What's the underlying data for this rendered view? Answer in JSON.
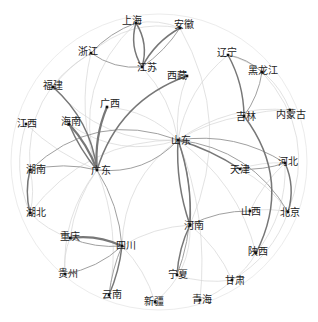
{
  "chart_data": {
    "type": "network",
    "layout": "circular-ish force layout with curved edges",
    "edge_style": "curved arcs, gray, thickness and darkness proportional to weight",
    "colors": {
      "node": "#111111",
      "label": "#222222",
      "edge_strong": "#777777",
      "edge_medium": "#a0a0a0",
      "edge_weak": "#d6d6d6"
    },
    "nodes": [
      {
        "id": "shanghai",
        "label": "上海",
        "x": 136,
        "y": 23,
        "lx": -14,
        "ly": -3
      },
      {
        "id": "anhui",
        "label": "安徽",
        "x": 180,
        "y": 28,
        "lx": -6,
        "ly": -4
      },
      {
        "id": "zhejiang",
        "label": "浙江",
        "x": 91,
        "y": 53,
        "lx": -13,
        "ly": -2
      },
      {
        "id": "jiangsu",
        "label": "江苏",
        "x": 142,
        "y": 67,
        "lx": -5,
        "ly": 0
      },
      {
        "id": "liaoning",
        "label": "辽宁",
        "x": 228,
        "y": 55,
        "lx": -11,
        "ly": -3
      },
      {
        "id": "heilongjiang",
        "label": "黑龙江",
        "x": 262,
        "y": 72,
        "lx": -14,
        "ly": -2
      },
      {
        "id": "xizang",
        "label": "西藏",
        "x": 187,
        "y": 76,
        "lx": -20,
        "ly": -1
      },
      {
        "id": "fujian",
        "label": "福建",
        "x": 53,
        "y": 87,
        "lx": -10,
        "ly": -2
      },
      {
        "id": "guangxi",
        "label": "广西",
        "x": 107,
        "y": 107,
        "lx": -7,
        "ly": -4
      },
      {
        "id": "jilin",
        "label": "吉林",
        "x": 244,
        "y": 116,
        "lx": -8,
        "ly": 0
      },
      {
        "id": "neimenggu",
        "label": "内蒙古",
        "x": 290,
        "y": 110,
        "lx": -14,
        "ly": 4
      },
      {
        "id": "hainan",
        "label": "海南",
        "x": 69,
        "y": 124,
        "lx": -8,
        "ly": -3
      },
      {
        "id": "jiangxi",
        "label": "江西",
        "x": 26,
        "y": 124,
        "lx": -9,
        "ly": -1
      },
      {
        "id": "shandong",
        "label": "山东",
        "x": 178,
        "y": 140,
        "lx": -7,
        "ly": 0
      },
      {
        "id": "hunan",
        "label": "湖南",
        "x": 30,
        "y": 170,
        "lx": -4,
        "ly": -1
      },
      {
        "id": "guangdong",
        "label": "广东",
        "x": 97,
        "y": 170,
        "lx": -6,
        "ly": 0
      },
      {
        "id": "tianjin",
        "label": "天津",
        "x": 240,
        "y": 169,
        "lx": -10,
        "ly": 0
      },
      {
        "id": "hebei",
        "label": "河北",
        "x": 285,
        "y": 163,
        "lx": -7,
        "ly": -2
      },
      {
        "id": "hubei",
        "label": "湖北",
        "x": 30,
        "y": 213,
        "lx": -4,
        "ly": -1
      },
      {
        "id": "shanxi",
        "label": "山西",
        "x": 250,
        "y": 211,
        "lx": -9,
        "ly": 0
      },
      {
        "id": "beijing",
        "label": "北京",
        "x": 288,
        "y": 212,
        "lx": -8,
        "ly": 0
      },
      {
        "id": "henan",
        "label": "河南",
        "x": 190,
        "y": 225,
        "lx": -6,
        "ly": 0
      },
      {
        "id": "chongqing",
        "label": "重庆",
        "x": 70,
        "y": 238,
        "lx": -10,
        "ly": -2
      },
      {
        "id": "sichuan",
        "label": "四川",
        "x": 122,
        "y": 246,
        "lx": -6,
        "ly": -1
      },
      {
        "id": "shaanxi",
        "label": "陕西",
        "x": 256,
        "y": 253,
        "lx": -8,
        "ly": -2
      },
      {
        "id": "guizhou",
        "label": "贵州",
        "x": 65,
        "y": 274,
        "lx": -7,
        "ly": -1
      },
      {
        "id": "ningxia",
        "label": "宁夏",
        "x": 177,
        "y": 275,
        "lx": -9,
        "ly": -1
      },
      {
        "id": "gansu",
        "label": "甘肃",
        "x": 232,
        "y": 280,
        "lx": -7,
        "ly": 0
      },
      {
        "id": "yunnan",
        "label": "云南",
        "x": 109,
        "y": 295,
        "lx": -7,
        "ly": -1
      },
      {
        "id": "xinjiang",
        "label": "新疆",
        "x": 155,
        "y": 302,
        "lx": -11,
        "ly": -1
      },
      {
        "id": "qinghai",
        "label": "青海",
        "x": 200,
        "y": 300,
        "lx": -8,
        "ly": -1
      }
    ],
    "edges": [
      {
        "s": "shanghai",
        "t": "jiangsu",
        "w": 3,
        "c": 18
      },
      {
        "s": "jiangsu",
        "t": "shanghai",
        "w": 3,
        "c": 18
      },
      {
        "s": "anhui",
        "t": "jiangsu",
        "w": 3,
        "c": 12
      },
      {
        "s": "anhui",
        "t": "jiangsu",
        "w": 2,
        "c": -8
      },
      {
        "s": "zhejiang",
        "t": "jiangsu",
        "w": 2,
        "c": 15
      },
      {
        "s": "zhejiang",
        "t": "shanghai",
        "w": 2,
        "c": -10
      },
      {
        "s": "zhejiang",
        "t": "anhui",
        "w": 1,
        "c": -20
      },
      {
        "s": "shanghai",
        "t": "anhui",
        "w": 1,
        "c": -12
      },
      {
        "s": "liaoning",
        "t": "jilin",
        "w": 3,
        "c": -10
      },
      {
        "s": "liaoning",
        "t": "heilongjiang",
        "w": 2,
        "c": -12
      },
      {
        "s": "heilongjiang",
        "t": "jilin",
        "w": 2,
        "c": -10
      },
      {
        "s": "jilin",
        "t": "shaanxi",
        "w": 3,
        "c": -25
      },
      {
        "s": "liaoning",
        "t": "shandong",
        "w": 1,
        "c": 15
      },
      {
        "s": "xizang",
        "t": "guangdong",
        "w": 3,
        "c": 20
      },
      {
        "s": "fujian",
        "t": "guangdong",
        "w": 3,
        "c": -15
      },
      {
        "s": "guangxi",
        "t": "guangdong",
        "w": 4,
        "c": 10
      },
      {
        "s": "hainan",
        "t": "guangdong",
        "w": 4,
        "c": -8
      },
      {
        "s": "hainan",
        "t": "guangdong",
        "w": 3,
        "c": 6
      },
      {
        "s": "hunan",
        "t": "guangdong",
        "w": 2,
        "c": -10
      },
      {
        "s": "hunan",
        "t": "hubei",
        "w": 3,
        "c": 10
      },
      {
        "s": "hunan",
        "t": "hubei",
        "w": 1,
        "c": -10
      },
      {
        "s": "hunan",
        "t": "shandong",
        "w": 2,
        "c": -25
      },
      {
        "s": "guangdong",
        "t": "shandong",
        "w": 2,
        "c": 20
      },
      {
        "s": "guangdong",
        "t": "sichuan",
        "w": 2,
        "c": -10
      },
      {
        "s": "guangdong",
        "t": "chongqing",
        "w": 1,
        "c": 10
      },
      {
        "s": "chongqing",
        "t": "sichuan",
        "w": 4,
        "c": -12
      },
      {
        "s": "chongqing",
        "t": "sichuan",
        "w": 2,
        "c": 10
      },
      {
        "s": "guizhou",
        "t": "sichuan",
        "w": 2,
        "c": 12
      },
      {
        "s": "yunnan",
        "t": "sichuan",
        "w": 3,
        "c": 6
      },
      {
        "s": "yunnan",
        "t": "sichuan",
        "w": 2,
        "c": -6
      },
      {
        "s": "shandong",
        "t": "henan",
        "w": 3,
        "c": 8
      },
      {
        "s": "shandong",
        "t": "henan",
        "w": 3,
        "c": -8
      },
      {
        "s": "shandong",
        "t": "hebei",
        "w": 2,
        "c": -15
      },
      {
        "s": "shandong",
        "t": "tianjin",
        "w": 3,
        "c": -6
      },
      {
        "s": "shandong",
        "t": "beijing",
        "w": 2,
        "c": -20
      },
      {
        "s": "shandong",
        "t": "jilin",
        "w": 1,
        "c": -8
      },
      {
        "s": "shandong",
        "t": "ningxia",
        "w": 2,
        "c": -15
      },
      {
        "s": "shandong",
        "t": "qinghai",
        "w": 1,
        "c": -10
      },
      {
        "s": "tianjin",
        "t": "hebei",
        "w": 2,
        "c": 8
      },
      {
        "s": "tianjin",
        "t": "hebei",
        "w": 1,
        "c": -8
      },
      {
        "s": "hebei",
        "t": "beijing",
        "w": 3,
        "c": -15
      },
      {
        "s": "hebei",
        "t": "shanxi",
        "w": 1,
        "c": 8
      },
      {
        "s": "henan",
        "t": "shanxi",
        "w": 2,
        "c": -10
      },
      {
        "s": "henan",
        "t": "ningxia",
        "w": 3,
        "c": 8
      },
      {
        "s": "henan",
        "t": "sichuan",
        "w": 1,
        "c": 10
      },
      {
        "s": "henan",
        "t": "gansu",
        "w": 1,
        "c": -10
      },
      {
        "s": "shaanxi",
        "t": "gansu",
        "w": 1,
        "c": -10
      },
      {
        "s": "sichuan",
        "t": "xinjiang",
        "w": 1,
        "c": -10
      },
      {
        "s": "jiangxi",
        "t": "guangdong",
        "w": 1,
        "c": 8
      },
      {
        "s": "fujian",
        "t": "zhejiang",
        "w": 1,
        "c": -8
      },
      {
        "s": "neimenggu",
        "t": "shandong",
        "w": 1,
        "c": 15
      },
      {
        "s": "shandong",
        "t": "shaanxi",
        "w": 1,
        "c": -15
      },
      {
        "s": "guangdong",
        "t": "yunnan",
        "w": 1,
        "c": -12
      },
      {
        "s": "guangdong",
        "t": "guizhou",
        "w": 1,
        "c": 15
      },
      {
        "s": "zhejiang",
        "t": "guangdong",
        "w": 1,
        "c": 12
      },
      {
        "s": "jiangsu",
        "t": "shandong",
        "w": 1,
        "c": -12
      },
      {
        "s": "hubei",
        "t": "shandong",
        "w": 1,
        "c": -20
      },
      {
        "s": "jiangxi",
        "t": "hubei",
        "w": 1,
        "c": 15
      },
      {
        "s": "fujian",
        "t": "shandong",
        "w": 1,
        "c": 20
      },
      {
        "s": "anhui",
        "t": "henan",
        "w": 1,
        "c": -20
      },
      {
        "s": "heilongjiang",
        "t": "beijing",
        "w": 1,
        "c": -25
      },
      {
        "s": "qinghai",
        "t": "gansu",
        "w": 1,
        "c": 10
      },
      {
        "s": "xinjiang",
        "t": "henan",
        "w": 1,
        "c": 20
      },
      {
        "s": "ningxia",
        "t": "gansu",
        "w": 1,
        "c": 10
      },
      {
        "s": "jilin",
        "t": "neimenggu",
        "w": 1,
        "c": -6
      },
      {
        "s": "liaoning",
        "t": "neimenggu",
        "w": 1,
        "c": -20
      },
      {
        "s": "guangxi",
        "t": "shandong",
        "w": 1,
        "c": -15
      },
      {
        "s": "hainan",
        "t": "shandong",
        "w": 1,
        "c": 20
      },
      {
        "s": "chongqing",
        "t": "hubei",
        "w": 1,
        "c": -10
      },
      {
        "s": "guizhou",
        "t": "chongqing",
        "w": 1,
        "c": -10
      },
      {
        "s": "shanxi",
        "t": "beijing",
        "w": 1,
        "c": -8
      },
      {
        "s": "tianjin",
        "t": "beijing",
        "w": 1,
        "c": -10
      },
      {
        "s": "sichuan",
        "t": "shandong",
        "w": 1,
        "c": -20
      },
      {
        "s": "xizang",
        "t": "shandong",
        "w": 1,
        "c": 10
      },
      {
        "s": "shanghai",
        "t": "guangdong",
        "w": 1,
        "c": 25
      },
      {
        "s": "zhejiang",
        "t": "hunan",
        "w": 1,
        "c": 25
      },
      {
        "s": "gansu",
        "t": "beijing",
        "w": 1,
        "c": 15
      },
      {
        "s": "shaanxi",
        "t": "hebei",
        "w": 1,
        "c": 15
      }
    ]
  }
}
